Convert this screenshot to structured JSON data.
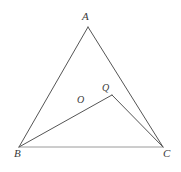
{
  "figure": {
    "background_color": "#ffffff",
    "stroke_color": "#555555",
    "base_stroke_color": "#9a9a9a",
    "label_color": "#3a3a3a",
    "stroke_width": 1,
    "labels": {
      "a": "A",
      "b": "B",
      "c": "C",
      "o": "O",
      "q": "Q"
    },
    "points": {
      "A": {
        "x": 88,
        "y": 27
      },
      "B": {
        "x": 19,
        "y": 147
      },
      "C": {
        "x": 163,
        "y": 147
      },
      "Q": {
        "x": 112,
        "y": 95
      }
    },
    "segments": [
      {
        "name": "side-ab",
        "from": "A",
        "to": "B"
      },
      {
        "name": "side-ac",
        "from": "A",
        "to": "C"
      },
      {
        "name": "side-bc",
        "from": "B",
        "to": "C"
      },
      {
        "name": "segment-bq",
        "from": "B",
        "to": "Q"
      },
      {
        "name": "segment-qc",
        "from": "Q",
        "to": "C"
      }
    ]
  }
}
